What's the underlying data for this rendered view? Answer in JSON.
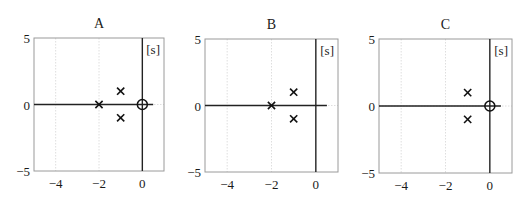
{
  "figure": {
    "width": 529,
    "height": 199,
    "colors": {
      "frame": "#9a9a9a",
      "grid": "#d6d6d6",
      "axis": "#222222",
      "marker": "#111111",
      "text": "#1a1a1a"
    }
  },
  "chart_data": [
    {
      "type": "scatter",
      "title": "A",
      "plane_label": "[s]",
      "xlabel": "Re",
      "ylabel": "Im",
      "xlim": [
        -5,
        1
      ],
      "ylim": [
        -5,
        5
      ],
      "xticks": [
        -4,
        -2,
        0
      ],
      "xtick_labels": [
        "−4",
        "−2",
        "0"
      ],
      "yticks": [
        5,
        0,
        -5
      ],
      "ytick_labels": [
        "5",
        "0",
        "−5"
      ],
      "grid": true,
      "poles": [
        [
          -2,
          0
        ],
        [
          -1,
          1
        ],
        [
          -1,
          -1
        ]
      ],
      "zeros": [
        [
          0,
          0
        ]
      ],
      "frame_px": {
        "left": 34,
        "top": 38,
        "width": 130,
        "height": 133
      }
    },
    {
      "type": "scatter",
      "title": "B",
      "plane_label": "[s]",
      "xlabel": "Re",
      "ylabel": "Im",
      "xlim": [
        -5,
        1
      ],
      "ylim": [
        -5,
        5
      ],
      "xticks": [
        -4,
        -2,
        0
      ],
      "xtick_labels": [
        "−4",
        "−2",
        "0"
      ],
      "yticks": [
        5,
        0,
        -5
      ],
      "ytick_labels": [
        "5",
        "0",
        "−5"
      ],
      "grid": true,
      "poles": [
        [
          -2,
          0
        ],
        [
          -1,
          1
        ],
        [
          -1,
          -1
        ]
      ],
      "zeros": [],
      "frame_px": {
        "left": 205,
        "top": 39,
        "width": 133,
        "height": 133
      }
    },
    {
      "type": "scatter",
      "title": "C",
      "plane_label": "[s]",
      "xlabel": "Re",
      "ylabel": "Im",
      "xlim": [
        -5,
        1
      ],
      "ylim": [
        -5,
        5
      ],
      "xticks": [
        -4,
        -2,
        0
      ],
      "xtick_labels": [
        "−4",
        "−2",
        "0"
      ],
      "yticks": [
        5,
        0,
        -5
      ],
      "ytick_labels": [
        "5",
        "0",
        "−5"
      ],
      "grid": true,
      "poles": [
        [
          -1,
          1
        ],
        [
          -1,
          -1
        ]
      ],
      "zeros": [
        [
          0,
          0
        ]
      ],
      "frame_px": {
        "left": 379,
        "top": 39,
        "width": 133,
        "height": 134
      }
    }
  ]
}
